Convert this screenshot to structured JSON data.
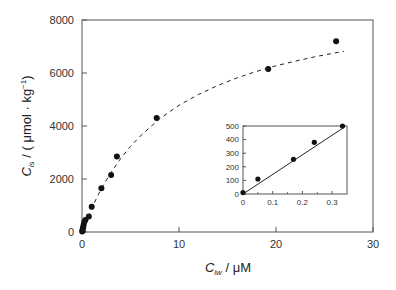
{
  "chart_data": [
    {
      "type": "scatter",
      "name": "main",
      "title": "",
      "xlabel": "C_iw / μM",
      "xlabel_parts": {
        "sym": "C",
        "sub": "iw",
        "rest": " / μM"
      },
      "ylabel": "C_is / ( μmol · kg⁻¹)",
      "ylabel_parts": {
        "sym": "C",
        "sub": "is",
        "rest": " / ( μmol · kg",
        "sup": "−1",
        "close": ")"
      },
      "xlim": [
        0,
        30
      ],
      "ylim": [
        0,
        8000
      ],
      "xticks": [
        0,
        10,
        20,
        30
      ],
      "yticks": [
        0,
        2000,
        4000,
        6000,
        8000
      ],
      "grid": false,
      "legend": null,
      "series": [
        {
          "name": "measured",
          "marker": "filled-circle",
          "x": [
            0.02,
            0.05,
            0.08,
            0.12,
            0.17,
            0.24,
            0.35,
            0.7,
            1.0,
            2.0,
            3.0,
            3.6,
            7.7,
            19.2,
            26.2
          ],
          "y": [
            20,
            60,
            120,
            180,
            260,
            380,
            450,
            580,
            950,
            1650,
            2150,
            2850,
            4300,
            6150,
            7200
          ]
        },
        {
          "name": "fit",
          "style": "dashed-line",
          "x": [
            0,
            1,
            2,
            3,
            4,
            5,
            6,
            8,
            10,
            12,
            14,
            16,
            18,
            20,
            22,
            24,
            26,
            27
          ],
          "y": [
            0,
            900,
            1650,
            2250,
            2780,
            3230,
            3620,
            4270,
            4780,
            5190,
            5530,
            5820,
            6060,
            6270,
            6450,
            6610,
            6750,
            6820
          ]
        }
      ]
    },
    {
      "type": "scatter",
      "name": "inset",
      "title": "",
      "xlabel": "",
      "ylabel": "",
      "xlim": [
        0,
        0.35
      ],
      "ylim": [
        0,
        500
      ],
      "xticks": [
        0,
        0.1,
        0.2,
        0.3
      ],
      "xtick_labels": [
        "0",
        "0.1",
        "0.2",
        "0.3"
      ],
      "yticks": [
        0,
        100,
        200,
        300,
        400,
        500
      ],
      "grid": false,
      "series": [
        {
          "name": "measured-low",
          "marker": "filled-circle",
          "x": [
            0,
            0.05,
            0.17,
            0.24,
            0.335
          ],
          "y": [
            10,
            110,
            255,
            380,
            500
          ]
        },
        {
          "name": "linear-fit",
          "style": "solid-line",
          "x": [
            0,
            0.34
          ],
          "y": [
            0,
            490
          ]
        }
      ]
    }
  ]
}
